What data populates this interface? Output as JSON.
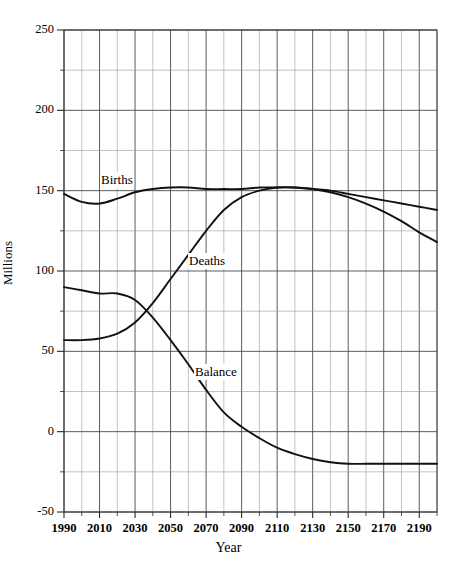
{
  "figure": {
    "title_fragment": "",
    "xlabel": "Year",
    "ylabel": "Millions"
  },
  "labels": {
    "births": "Births",
    "deaths": "Deaths",
    "balance": "Balance"
  },
  "chart_data": {
    "type": "line",
    "title": "",
    "xlabel": "Year",
    "ylabel": "Millions",
    "xlim": [
      1990,
      2200
    ],
    "ylim": [
      -50,
      250
    ],
    "xticks": [
      1990,
      2010,
      2030,
      2050,
      2070,
      2090,
      2110,
      2130,
      2150,
      2170,
      2190
    ],
    "xtick_labels": [
      "1990",
      "2010",
      "2030",
      "2050",
      "2070",
      "2090",
      "2110",
      "2130",
      "2150",
      "2170",
      "2190"
    ],
    "yticks": [
      -50,
      0,
      50,
      100,
      150,
      200,
      250
    ],
    "ytick_labels": [
      "-50",
      "0",
      "50",
      "100",
      "150",
      "200",
      "250"
    ],
    "grid": true,
    "grid_minor_x": 10,
    "grid_minor_y": 25,
    "legend": "inline-annotations",
    "x": [
      1990,
      2000,
      2010,
      2020,
      2030,
      2040,
      2050,
      2060,
      2070,
      2080,
      2090,
      2100,
      2110,
      2120,
      2130,
      2140,
      2150,
      2160,
      2170,
      2180,
      2190,
      2200
    ],
    "series": [
      {
        "name": "Births",
        "values": [
          148,
          143,
          142,
          145,
          149,
          151,
          152,
          152,
          151,
          151,
          151,
          152,
          152,
          152,
          151,
          150,
          148,
          146,
          144,
          142,
          140,
          138
        ]
      },
      {
        "name": "Deaths",
        "values": [
          57,
          57,
          58,
          61,
          68,
          80,
          95,
          110,
          125,
          138,
          146,
          150,
          152,
          152,
          151,
          149,
          146,
          142,
          137,
          131,
          124,
          118
        ]
      },
      {
        "name": "Balance",
        "values": [
          90,
          88,
          86,
          86,
          82,
          71,
          57,
          42,
          26,
          12,
          3,
          -4,
          -10,
          -14,
          -17,
          -19,
          -20,
          -20,
          -20,
          -20,
          -20,
          -20
        ]
      }
    ],
    "annotations": [
      {
        "text": "Births",
        "x": 2005,
        "y": 162
      },
      {
        "text": "Deaths",
        "x": 2060,
        "y": 113
      },
      {
        "text": "Balance",
        "x": 2060,
        "y": 50
      }
    ]
  }
}
